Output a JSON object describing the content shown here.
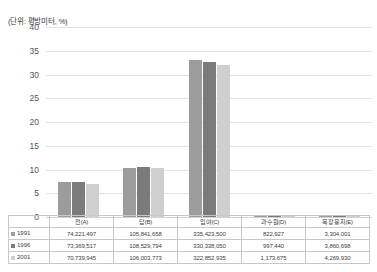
{
  "unit_note": "(단위: 평방미터, %)",
  "colors": {
    "series_1991": "#9c9c9c",
    "series_1996": "#7b7b7b",
    "series_2001": "#cfcfcf",
    "gridline": "#e2e2e2",
    "axis_text": "#555555",
    "table_border": "#c8c8c8"
  },
  "chart_data": {
    "type": "bar",
    "title": "",
    "subtitle": "",
    "xlabel": "",
    "ylabel": "",
    "unit_note": "(단위: 평방미터, %)",
    "categories": [
      "전(A)",
      "답(B)",
      "임야(C)",
      "과수원(D)",
      "목장용지(E)"
    ],
    "series": [
      {
        "name": "1991",
        "values": [
          7.3,
          10.3,
          33.1,
          0.08,
          0.33
        ]
      },
      {
        "name": "1996",
        "values": [
          7.3,
          10.6,
          32.7,
          0.1,
          0.38
        ]
      },
      {
        "name": "2001",
        "values": [
          6.9,
          10.3,
          32.0,
          0.12,
          0.42
        ]
      }
    ],
    "ylim": [
      0,
      40
    ],
    "yticks": [
      40,
      35,
      30,
      25,
      20,
      15,
      10,
      5,
      0
    ],
    "grid": true,
    "legend_position": "table-left"
  },
  "table": {
    "headers": [
      "전(A)",
      "답(B)",
      "임야(C)",
      "과수원(D)",
      "목장용지(E)"
    ],
    "rows": [
      {
        "year": "1991",
        "swatch": "#9c9c9c",
        "values": [
          "74,221,497",
          "105,841,658",
          "335,423,500",
          "822,927",
          "3,304,001"
        ]
      },
      {
        "year": "1996",
        "swatch": "#7b7b7b",
        "values": [
          "73,369,517",
          "108,529,794",
          "330,338,050",
          "997,440",
          "3,860,698"
        ]
      },
      {
        "year": "2001",
        "swatch": "#cfcfcf",
        "values": [
          "70,739,945",
          "106,003,773",
          "322,852,935",
          "1,173,675",
          "4,269,930"
        ]
      }
    ]
  }
}
